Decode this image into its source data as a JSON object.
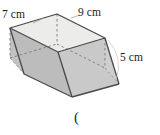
{
  "figure": {
    "type": "3d-rectangular-box-diagram",
    "labels": {
      "width": "7 cm",
      "length": "9 cm",
      "height": "5 cm"
    },
    "trailing_mark": "(",
    "colors": {
      "outline": "#4a4a4a",
      "hidden_edge": "#6e6e6e",
      "top_face": "#e9e9e9",
      "front_left_face": "#b9b9b9",
      "front_right_face": "#c6c6c6",
      "interior_left_face": "#dcdcdc",
      "interior_right_face": "#d2d2d2",
      "background": "#ffffff",
      "text": "#1b1b1b"
    },
    "vertices": {
      "top_left": "10,28",
      "top_back": "57,14",
      "top_right": "105,38",
      "top_front": "58,52",
      "bottom_left": "10,58",
      "bottom_back": "57,44",
      "bottom_right": "105,68",
      "bottom_front": "58,82",
      "base_front": "72,97",
      "base_left": "24,74",
      "base_right": "119,84"
    }
  }
}
